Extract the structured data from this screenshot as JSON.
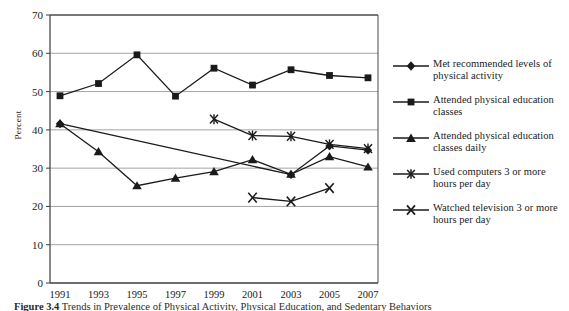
{
  "chart_data": {
    "type": "line",
    "title": "",
    "xlabel": "",
    "ylabel": "Percent",
    "ylim": [
      0,
      70
    ],
    "ytick_step": 10,
    "yticks": [
      "0",
      "10",
      "20",
      "30",
      "40",
      "50",
      "60",
      "70"
    ],
    "grid": true,
    "legend_position": "right",
    "x": [
      "1991",
      "1993",
      "1995",
      "1997",
      "1999",
      "2001",
      "2003",
      "2005",
      "2007"
    ],
    "series": [
      {
        "name": "Met recommended levels of physical activity",
        "marker": "diamond",
        "x": [
          "1991",
          "2003",
          "2005",
          "2007"
        ],
        "values": [
          41.6,
          28.3,
          35.8,
          34.7
        ]
      },
      {
        "name": "Attended physical education classes",
        "marker": "square",
        "x": [
          "1991",
          "1993",
          "1995",
          "1997",
          "1999",
          "2001",
          "2003",
          "2005",
          "2007"
        ],
        "values": [
          48.9,
          52.1,
          59.6,
          48.8,
          56.1,
          51.7,
          55.7,
          54.2,
          53.6
        ]
      },
      {
        "name": "Attended physical education classes daily",
        "marker": "triangle",
        "x": [
          "1991",
          "1993",
          "1995",
          "1997",
          "1999",
          "2001",
          "2003",
          "2005",
          "2007"
        ],
        "values": [
          41.6,
          34.3,
          25.4,
          27.4,
          29.1,
          32.2,
          28.4,
          33.0,
          30.3
        ]
      },
      {
        "name": "Used computers 3 or more hours per day",
        "marker": "asterisk",
        "x": [
          "1999",
          "2001",
          "2003",
          "2005",
          "2007"
        ],
        "values": [
          42.8,
          38.5,
          38.3,
          36.2,
          35.1
        ]
      },
      {
        "name": "Watched television 3 or more hours per day",
        "marker": "cross",
        "x": [
          "2001",
          "2003",
          "2005"
        ],
        "values": [
          22.3,
          21.3,
          24.8
        ]
      }
    ]
  },
  "axis": {
    "ylabel": "Percent",
    "yticks": [
      "70",
      "60",
      "50",
      "40",
      "30",
      "20",
      "10",
      "0"
    ],
    "xticks": [
      "1991",
      "1993",
      "1995",
      "1997",
      "1999",
      "2001",
      "2003",
      "2005",
      "2007"
    ]
  },
  "legend": {
    "items": [
      {
        "marker": "diamond-marker-icon",
        "label": "Met recommended levels of physical activity"
      },
      {
        "marker": "square-marker-icon",
        "label": "Attended physical education classes"
      },
      {
        "marker": "triangle-marker-icon",
        "label": "Attended physical education classes daily"
      },
      {
        "marker": "asterisk-marker-icon",
        "label": "Used computers 3 or more hours per day"
      },
      {
        "marker": "cross-marker-icon",
        "label": "Watched television 3 or more hours per day"
      }
    ]
  },
  "caption": {
    "number": "Figure 3.4",
    "text": "Trends in Prevalence of Physical Activity, Physical Education, and Sedentary Behaviors"
  },
  "colors": {
    "line": "#1a1a1a",
    "grid": "#9a9a9a",
    "axis": "#4a4a4a",
    "text": "#1a1a1a",
    "background": "#ffffff"
  }
}
